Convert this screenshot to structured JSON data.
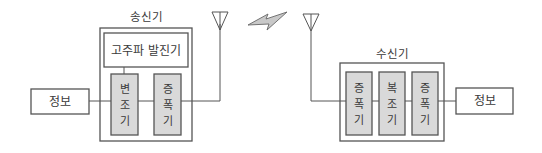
{
  "colors": {
    "line": "#555555",
    "box_fill": "#ffffff",
    "module_fill": "#d9d9d9",
    "bolt_fill": "#c8c8c8",
    "text": "#3a3a3a"
  },
  "transmitter": {
    "label": "송신기",
    "oscillator": "고주파 발진기",
    "modulator": [
      "변",
      "조",
      "기"
    ],
    "amplifier": [
      "증",
      "폭",
      "기"
    ]
  },
  "receiver": {
    "label": "수신기",
    "amplifier1": [
      "증",
      "폭",
      "기"
    ],
    "demodulator": [
      "복",
      "조",
      "기"
    ],
    "amplifier2": [
      "증",
      "폭",
      "기"
    ]
  },
  "info_left": {
    "label": "정보"
  },
  "info_right": {
    "label": "정보"
  },
  "icons": {
    "tx_antenna": "antenna-icon",
    "rx_antenna": "antenna-icon",
    "wireless": "lightning-bolt-icon"
  }
}
